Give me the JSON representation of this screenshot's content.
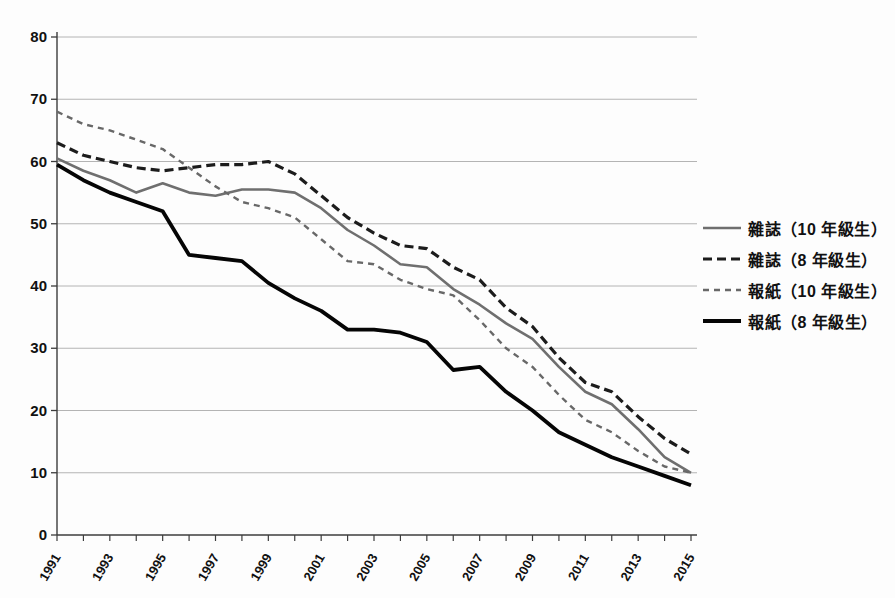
{
  "page": {
    "background_color": "#fdfdfd",
    "title": ""
  },
  "chart_data": {
    "type": "line",
    "title": "",
    "xlabel": "",
    "ylabel": "",
    "grid": true,
    "legend_position": "right",
    "axis_color": "#3c3c3c",
    "grid_color": "#ababab",
    "label_color": "#111111",
    "ylim": [
      0,
      80
    ],
    "y_ticks": [
      0,
      10,
      20,
      30,
      40,
      50,
      60,
      70,
      80
    ],
    "x": [
      1991,
      1992,
      1993,
      1994,
      1995,
      1996,
      1997,
      1998,
      1999,
      2000,
      2001,
      2002,
      2003,
      2004,
      2005,
      2006,
      2007,
      2008,
      2009,
      2010,
      2011,
      2012,
      2013,
      2014,
      2015
    ],
    "x_tick_labels": [
      "1991",
      "1993",
      "1995",
      "1997",
      "1999",
      "2001",
      "2003",
      "2005",
      "2007",
      "2009",
      "2011",
      "2013",
      "2015"
    ],
    "x_label_rotation": -60,
    "series": [
      {
        "name": "雜誌（10 年級生）",
        "line_style": "solid",
        "color": "#6f6f6f",
        "stroke_width": 2.6,
        "dash": "",
        "values": [
          60.5,
          58.5,
          57,
          55,
          56.5,
          55,
          54.5,
          55.5,
          55.5,
          55,
          52.5,
          49,
          46.5,
          43.5,
          43,
          39.5,
          37,
          34,
          31.5,
          27,
          23,
          21,
          17,
          12.5,
          10
        ]
      },
      {
        "name": "雜誌（8 年級生）",
        "line_style": "dashed",
        "color": "#1c1c1c",
        "stroke_width": 3.2,
        "dash": "9 5",
        "values": [
          63,
          61,
          60,
          59,
          58.5,
          59,
          59.5,
          59.5,
          60,
          58,
          54.5,
          51,
          48.5,
          46.5,
          46,
          43,
          41,
          36.5,
          33.5,
          28.5,
          24.5,
          23,
          19,
          15.5,
          13
        ]
      },
      {
        "name": "報紙（10 年級生）",
        "line_style": "dashed",
        "color": "#686868",
        "stroke_width": 2.4,
        "dash": "6 5",
        "values": [
          68,
          66,
          65,
          63.5,
          62,
          59,
          56,
          53.5,
          52.5,
          51,
          47.5,
          44,
          43.5,
          41,
          39.5,
          38.5,
          34.5,
          30,
          27,
          22.5,
          18.5,
          16.5,
          13.5,
          11,
          10
        ]
      },
      {
        "name": "報紙（8 年級生）",
        "line_style": "solid",
        "color": "#050505",
        "stroke_width": 3.8,
        "dash": "",
        "values": [
          59.5,
          57,
          55,
          53.5,
          52,
          45,
          44.5,
          44,
          40.5,
          38,
          36,
          33,
          33,
          32.5,
          31,
          26.5,
          27,
          23,
          20,
          16.5,
          14.5,
          12.5,
          11,
          9.5,
          8
        ]
      }
    ]
  }
}
